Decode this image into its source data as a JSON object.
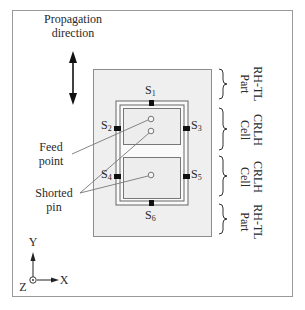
{
  "figure": {
    "propagation_label_line1": "Propagation",
    "propagation_label_line2": "direction",
    "feed_label_line1": "Feed",
    "feed_label_line2": "point",
    "shorted_label_line1": "Shorted",
    "shorted_label_line2": "pin",
    "slots": [
      {
        "letter": "S",
        "index": "1"
      },
      {
        "letter": "S",
        "index": "2"
      },
      {
        "letter": "S",
        "index": "3"
      },
      {
        "letter": "S",
        "index": "4"
      },
      {
        "letter": "S",
        "index": "5"
      },
      {
        "letter": "S",
        "index": "6"
      }
    ],
    "sections": [
      {
        "line1": "RH-TL",
        "line2": "Part"
      },
      {
        "line1": "CRLH",
        "line2": "Cell"
      },
      {
        "line1": "CRLH",
        "line2": "Cell"
      },
      {
        "line1": "RH-TL",
        "line2": "Part"
      }
    ],
    "axes": {
      "y": "Y",
      "x": "X",
      "z": "Z"
    },
    "colors": {
      "frame": "#9a9a9a",
      "substrate": "#efefef",
      "patch": "#ededed",
      "line": "#555555",
      "slot": "#111111"
    }
  }
}
